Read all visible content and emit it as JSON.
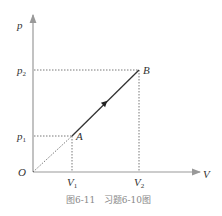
{
  "diagram": {
    "axes": {
      "y_label": "p",
      "x_label": "V",
      "origin_label": "O"
    },
    "y_ticks": [
      {
        "label": "p",
        "sub": "2",
        "y": 70
      },
      {
        "label": "p",
        "sub": "1",
        "y": 136
      }
    ],
    "x_ticks": [
      {
        "label": "V",
        "sub": "1",
        "x": 72
      },
      {
        "label": "V",
        "sub": "2",
        "x": 139
      }
    ],
    "points": [
      {
        "name": "A",
        "x": 72,
        "y": 136
      },
      {
        "name": "B",
        "x": 139,
        "y": 70
      }
    ],
    "process": {
      "from": "A",
      "to": "B",
      "style": "solid-with-arrow"
    },
    "extension": {
      "from": "O",
      "to": "A",
      "style": "dotted"
    },
    "caption": "图6-11   习题6-10图",
    "colors": {
      "axis": "#999999",
      "line": "#333333",
      "dotted": "#555555",
      "caption": "#888888"
    }
  }
}
